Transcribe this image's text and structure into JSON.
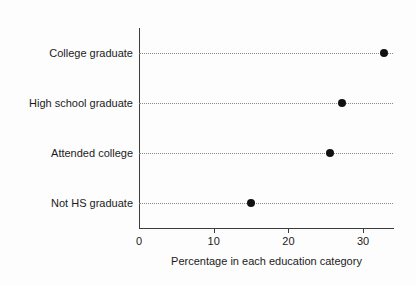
{
  "chart_data": {
    "type": "scatter",
    "title": "",
    "subtitle": "",
    "xlabel": "Percentage in each education category",
    "ylabel": "",
    "categories": [
      "College graduate",
      "High school graduate",
      "Attended college",
      "Not HS graduate"
    ],
    "values": [
      32.8,
      27.2,
      25.6,
      15.0
    ],
    "series": [
      {
        "name": "Percentage",
        "values": [
          32.8,
          27.2,
          25.6,
          15.0
        ]
      }
    ],
    "xlim": [
      0,
      34
    ],
    "ylim": [
      0,
      4
    ],
    "xticks": [
      0,
      10,
      20,
      30
    ],
    "xtick_labels": [
      "0",
      "10",
      "20",
      "30"
    ],
    "grid": "horizontal-dotted",
    "legend": "none",
    "orientation": "horizontal",
    "marker": "filled-circle",
    "marker_color": "#111111",
    "gridline_color": "#8a8a8a",
    "axis_color": "#3c3c3c",
    "background_color": "#fdfdfd"
  }
}
